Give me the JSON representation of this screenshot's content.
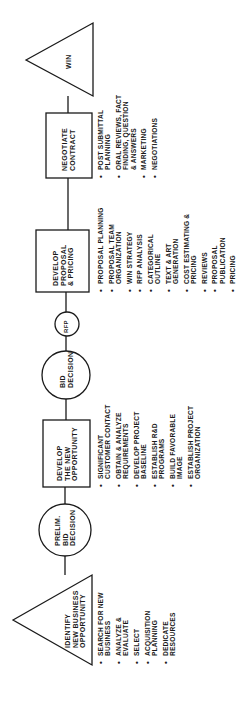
{
  "diagram": {
    "orientation": "rotated-90-ccw",
    "flow_direction": "left-to-right (rendered bottom-to-top)",
    "nodes": [
      {
        "id": "identify",
        "shape": "triangle",
        "label": "IDENTIFY\nNEW BUSINESS\nOPPORTUNITY",
        "items": [
          "SEARCH FOR NEW\nBUSINESS",
          "ANALYZE &\nEVALUATE",
          "SELECT",
          "ACQUISITION\nPLANNING",
          "DEDICATE\nRESOURCES"
        ]
      },
      {
        "id": "prelim",
        "shape": "circle",
        "label": "PRELIM.\nBID\nDECISION"
      },
      {
        "id": "develop_opportunity",
        "shape": "box",
        "label": "DEVELOP\nTHE NEW\nOPPORTUNITY",
        "items": [
          "SIGNIFICANT\nCUSTOMER CONTACT",
          "OBTAIN & ANALYZE\nREQUIREMENTS",
          "DEVELOP PROJECT\nBASELINE",
          "ESTABLISH R&D\nPROGRAMS",
          "BUILD FAVORABLE\nIMAGE",
          "ESTABLISH PROJECT\nORGANIZATION"
        ]
      },
      {
        "id": "bid",
        "shape": "circle",
        "label": "BID\nDECISION"
      },
      {
        "id": "rfp",
        "shape": "circle-small",
        "label": "RFP"
      },
      {
        "id": "develop_proposal",
        "shape": "box",
        "label": "DEVELOP\nPROPOSAL\n& PRICING",
        "items": [
          "PROPOSAL PLANNING",
          "PROPOSAL TEAM\nORGANIZATION",
          "WIN STRATEGY",
          "RFP ANALYSIS",
          "CATEGORICAL\nOUTLINE",
          "TEXT & ART\nGENERATION",
          "COST ESTIMATING &\nPRICING",
          "REVIEWS",
          "PROPOSAL\nPUBLICATION",
          "PRICING"
        ]
      },
      {
        "id": "negotiate",
        "shape": "box",
        "label": "NEGOTIATE\nCONTRACT",
        "items": [
          "POST SUBMITTAL\nPLANNING",
          "ORAL REVIEWS, FACT\nFINDING, QUESTION\n& ANSWERS",
          "MARKETING",
          "NEGOTIATIONS"
        ]
      },
      {
        "id": "win",
        "shape": "triangle",
        "label": "WIN"
      }
    ],
    "colors": {
      "ink": "#1a1a1a",
      "background": "#ffffff"
    }
  }
}
